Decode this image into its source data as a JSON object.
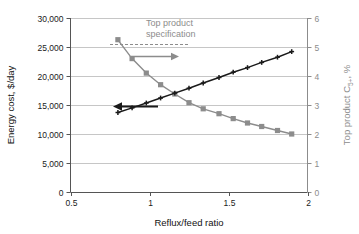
{
  "chart_data": {
    "type": "line",
    "title": "",
    "xlabel": "Reflux/feed ratio",
    "ylabel": "Energy cost, $/day",
    "y2label": "Top product C5+, %",
    "xlim": [
      0.5,
      2.0
    ],
    "ylim": [
      0,
      30000
    ],
    "y2lim": [
      0,
      6
    ],
    "grid": true,
    "legend": "none",
    "xticks": [
      "0.5",
      "1",
      "1.5",
      "2"
    ],
    "xtick_values": [
      0.5,
      1.0,
      1.5,
      2.0
    ],
    "yticks": [
      "0",
      "5,000",
      "10,000",
      "15,000",
      "20,000",
      "25,000",
      "30,000"
    ],
    "ytick_values": [
      0,
      5000,
      10000,
      15000,
      20000,
      25000,
      30000
    ],
    "y2ticks": [
      "0",
      "1",
      "2",
      "3",
      "4",
      "5",
      "6"
    ],
    "y2tick_values": [
      0,
      1,
      2,
      3,
      4,
      5,
      6
    ],
    "series": [
      {
        "name": "Energy cost, $/day",
        "axis": "left",
        "color": "#1a1a1a",
        "marker": "plus",
        "x": [
          0.8,
          0.89,
          0.98,
          1.07,
          1.16,
          1.25,
          1.34,
          1.44,
          1.53,
          1.62,
          1.71,
          1.81,
          1.9
        ],
        "values": [
          13700,
          14500,
          15350,
          16200,
          17050,
          17900,
          18800,
          19750,
          20650,
          21450,
          22350,
          23250,
          24200
        ]
      },
      {
        "name": "Top product C5+, %",
        "axis": "right",
        "color": "#8c8c8c",
        "marker": "square",
        "x": [
          0.8,
          0.89,
          0.98,
          1.07,
          1.16,
          1.25,
          1.34,
          1.44,
          1.53,
          1.62,
          1.71,
          1.81,
          1.9
        ],
        "values": [
          5.25,
          4.6,
          4.1,
          3.7,
          3.38,
          3.08,
          2.87,
          2.7,
          2.53,
          2.38,
          2.26,
          2.12,
          2.0
        ]
      }
    ],
    "annotations": [
      {
        "name": "top-product-specification",
        "text_line1": "Top product",
        "text_line2": "specification",
        "color": "#8c8c8c",
        "spec_level_right_axis": 5.1,
        "style": "dashed-horizontal-line"
      },
      {
        "name": "right-axis-pointer",
        "type": "arrow-right",
        "color": "#8c8c8c"
      },
      {
        "name": "left-axis-pointer",
        "type": "arrow-left",
        "color": "#1a1a1a"
      }
    ]
  }
}
